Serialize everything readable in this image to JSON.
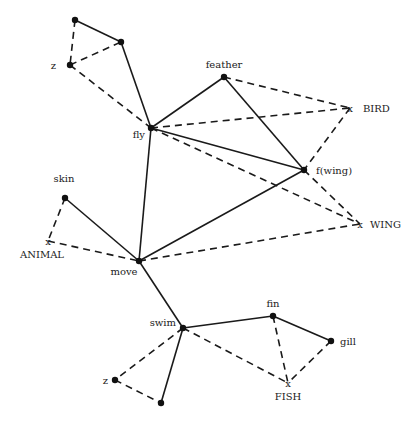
{
  "diagram": {
    "type": "semantic-network",
    "nodes": [
      {
        "id": "n_top",
        "label": "",
        "kind": "dot",
        "x": 75,
        "y": 20
      },
      {
        "id": "n_midtop",
        "label": "",
        "kind": "dot",
        "x": 121,
        "y": 42
      },
      {
        "id": "z_top",
        "label": "z",
        "kind": "dot",
        "x": 70,
        "y": 65,
        "lx": 56,
        "ly": 69,
        "anchor": "end"
      },
      {
        "id": "fly",
        "label": "fly",
        "kind": "dot",
        "x": 151,
        "y": 128,
        "lx": 145,
        "ly": 138,
        "anchor": "end"
      },
      {
        "id": "feather",
        "label": "feather",
        "kind": "dot",
        "x": 224,
        "y": 77,
        "lx": 224,
        "ly": 68,
        "anchor": "middle"
      },
      {
        "id": "bird",
        "label": "BIRD",
        "kind": "x",
        "x": 350,
        "y": 108,
        "lx": 363,
        "ly": 112,
        "anchor": "start"
      },
      {
        "id": "fwing",
        "label": "f(wing)",
        "kind": "dot",
        "x": 304,
        "y": 170,
        "lx": 316,
        "ly": 174,
        "anchor": "start"
      },
      {
        "id": "wing",
        "label": "WING",
        "kind": "x",
        "x": 360,
        "y": 224,
        "lx": 370,
        "ly": 228,
        "anchor": "start"
      },
      {
        "id": "skin",
        "label": "skin",
        "kind": "dot",
        "x": 65,
        "y": 198,
        "lx": 64,
        "ly": 182,
        "anchor": "middle"
      },
      {
        "id": "animal",
        "label": "ANIMAL",
        "kind": "x",
        "x": 48,
        "y": 241,
        "lx": 42,
        "ly": 258,
        "anchor": "middle"
      },
      {
        "id": "move",
        "label": "move",
        "kind": "dot",
        "x": 139,
        "y": 261,
        "lx": 124,
        "ly": 275,
        "anchor": "middle"
      },
      {
        "id": "swim",
        "label": "swim",
        "kind": "dot",
        "x": 183,
        "y": 328,
        "lx": 176,
        "ly": 326,
        "anchor": "end"
      },
      {
        "id": "fin",
        "label": "fin",
        "kind": "dot",
        "x": 273,
        "y": 316,
        "lx": 273,
        "ly": 307,
        "anchor": "middle"
      },
      {
        "id": "gill",
        "label": "gill",
        "kind": "dot",
        "x": 331,
        "y": 341,
        "lx": 340,
        "ly": 345,
        "anchor": "start"
      },
      {
        "id": "fish",
        "label": "FISH",
        "kind": "x",
        "x": 288,
        "y": 383,
        "lx": 288,
        "ly": 400,
        "anchor": "middle"
      },
      {
        "id": "z_bottom",
        "label": "z",
        "kind": "dot",
        "x": 115,
        "y": 380,
        "lx": 108,
        "ly": 384,
        "anchor": "end"
      },
      {
        "id": "n_bottom",
        "label": "",
        "kind": "dot",
        "x": 161,
        "y": 403
      }
    ],
    "edges": [
      {
        "from": "n_top",
        "to": "n_midtop",
        "style": "solid"
      },
      {
        "from": "n_midtop",
        "to": "fly",
        "style": "solid"
      },
      {
        "from": "n_top",
        "to": "z_top",
        "style": "dashed"
      },
      {
        "from": "z_top",
        "to": "n_midtop",
        "style": "dashed"
      },
      {
        "from": "z_top",
        "to": "fly",
        "style": "dashed"
      },
      {
        "from": "fly",
        "to": "feather",
        "style": "solid"
      },
      {
        "from": "feather",
        "to": "fwing",
        "style": "solid"
      },
      {
        "from": "fly",
        "to": "fwing",
        "style": "solid"
      },
      {
        "from": "fly",
        "to": "bird",
        "style": "dashed"
      },
      {
        "from": "feather",
        "to": "bird",
        "style": "dashed"
      },
      {
        "from": "bird",
        "to": "fwing",
        "style": "dashed"
      },
      {
        "from": "fly",
        "to": "wing",
        "style": "dashed"
      },
      {
        "from": "fwing",
        "to": "wing",
        "style": "dashed"
      },
      {
        "from": "fly",
        "to": "move",
        "style": "solid"
      },
      {
        "from": "move",
        "to": "fwing",
        "style": "solid"
      },
      {
        "from": "move",
        "to": "wing",
        "style": "dashed"
      },
      {
        "from": "skin",
        "to": "move",
        "style": "solid"
      },
      {
        "from": "skin",
        "to": "animal",
        "style": "dashed"
      },
      {
        "from": "animal",
        "to": "move",
        "style": "dashed"
      },
      {
        "from": "move",
        "to": "swim",
        "style": "solid"
      },
      {
        "from": "swim",
        "to": "fin",
        "style": "solid"
      },
      {
        "from": "fin",
        "to": "gill",
        "style": "solid"
      },
      {
        "from": "swim",
        "to": "fish",
        "style": "dashed"
      },
      {
        "from": "fin",
        "to": "fish",
        "style": "dashed"
      },
      {
        "from": "gill",
        "to": "fish",
        "style": "dashed"
      },
      {
        "from": "swim",
        "to": "n_bottom",
        "style": "solid"
      },
      {
        "from": "swim",
        "to": "z_bottom",
        "style": "dashed"
      },
      {
        "from": "z_bottom",
        "to": "n_bottom",
        "style": "dashed"
      }
    ]
  }
}
